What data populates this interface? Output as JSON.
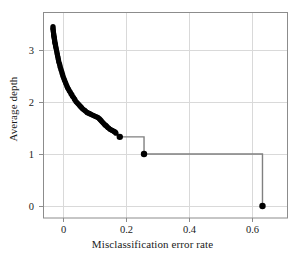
{
  "figure": {
    "background_color": "#ffffff",
    "frame_color": "#8c8c8c",
    "grid_color": "#d9d9d9",
    "data_color": "#000000",
    "step_line_color": "#808080"
  },
  "chart_data": {
    "type": "scatter",
    "title": "",
    "xlabel": "Misclassification error rate",
    "ylabel": "Average depth",
    "xlim": [
      -0.0317,
      0.746
    ],
    "ylim": [
      -0.231,
      3.731
    ],
    "xticks": [
      0,
      0.2,
      0.4,
      0.6
    ],
    "xticklabels": [
      "0",
      "0.2",
      "0.4",
      "0.6"
    ],
    "yticks": [
      0,
      1,
      2,
      3
    ],
    "yticklabels": [
      "0",
      "1",
      "2",
      "3"
    ],
    "grid": true,
    "legend": "none",
    "series": [
      {
        "name": "Pruned tree path (dense markers)",
        "marker": "filled-circle",
        "x": [
          0.0,
          0.0,
          0.0,
          0.001,
          0.001,
          0.002,
          0.002,
          0.003,
          0.003,
          0.004,
          0.004,
          0.005,
          0.005,
          0.006,
          0.006,
          0.007,
          0.008,
          0.008,
          0.009,
          0.01,
          0.011,
          0.012,
          0.013,
          0.014,
          0.015,
          0.016,
          0.017,
          0.018,
          0.019,
          0.021,
          0.022,
          0.023,
          0.025,
          0.026,
          0.028,
          0.029,
          0.031,
          0.032,
          0.034,
          0.036,
          0.038,
          0.04,
          0.042,
          0.044,
          0.046,
          0.048,
          0.05,
          0.052,
          0.055,
          0.057,
          0.06,
          0.062,
          0.065,
          0.068,
          0.07,
          0.073,
          0.076,
          0.079,
          0.082,
          0.085,
          0.088,
          0.091,
          0.094,
          0.098,
          0.101,
          0.104,
          0.108,
          0.111,
          0.115,
          0.118,
          0.122,
          0.125,
          0.129,
          0.132,
          0.136,
          0.14,
          0.143,
          0.147,
          0.15,
          0.153,
          0.156,
          0.159,
          0.162,
          0.165,
          0.168,
          0.171,
          0.174,
          0.177,
          0.18,
          0.183,
          0.186,
          0.189,
          0.192,
          0.195,
          0.198,
          0.2
        ],
        "y": [
          3.45,
          3.42,
          3.4,
          3.37,
          3.35,
          3.32,
          3.3,
          3.28,
          3.26,
          3.24,
          3.22,
          3.2,
          3.18,
          3.16,
          3.14,
          3.12,
          3.1,
          3.08,
          3.06,
          3.03,
          3.0,
          2.97,
          2.94,
          2.91,
          2.88,
          2.85,
          2.82,
          2.79,
          2.76,
          2.73,
          2.7,
          2.67,
          2.64,
          2.61,
          2.58,
          2.55,
          2.52,
          2.49,
          2.46,
          2.43,
          2.4,
          2.37,
          2.34,
          2.31,
          2.28,
          2.26,
          2.24,
          2.21,
          2.19,
          2.16,
          2.14,
          2.11,
          2.09,
          2.06,
          2.04,
          2.01,
          1.99,
          1.97,
          1.95,
          1.93,
          1.91,
          1.89,
          1.87,
          1.85,
          1.84,
          1.82,
          1.8,
          1.79,
          1.78,
          1.77,
          1.76,
          1.75,
          1.74,
          1.73,
          1.72,
          1.71,
          1.7,
          1.68,
          1.66,
          1.64,
          1.62,
          1.6,
          1.58,
          1.56,
          1.55,
          1.53,
          1.51,
          1.5,
          1.48,
          1.47,
          1.46,
          1.45,
          1.44,
          1.43,
          1.42,
          1.4
        ]
      },
      {
        "name": "Step nodes",
        "marker": "filled-circle-large",
        "x": [
          0.212,
          0.289,
          0.665
        ],
        "y": [
          1.33,
          1.0,
          0.0
        ]
      }
    ],
    "step_path": [
      {
        "x": 0.212,
        "y": 1.33
      },
      {
        "x": 0.289,
        "y": 1.33
      },
      {
        "x": 0.289,
        "y": 1.0
      },
      {
        "x": 0.665,
        "y": 1.0
      },
      {
        "x": 0.665,
        "y": 0.0
      }
    ]
  }
}
